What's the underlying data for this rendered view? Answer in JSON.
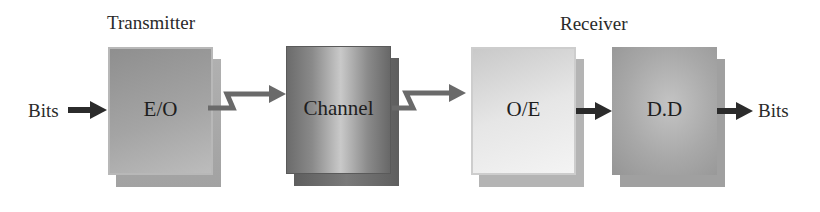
{
  "diagram": {
    "groups": [
      {
        "label": "Transmitter"
      },
      {
        "label": "Receiver"
      }
    ],
    "input_label": "Bits",
    "output_label": "Bits",
    "blocks": [
      {
        "id": "eo",
        "label": "E/O",
        "front_color": "#9e9e9e",
        "back_color": "#a9a9a9"
      },
      {
        "id": "channel",
        "label": "Channel",
        "front_color": "#8d8d8d",
        "back_color": "#6f6f6f"
      },
      {
        "id": "oe",
        "label": "O/E",
        "front_color": "#e4e4e4",
        "back_color": "#b3b3b3"
      },
      {
        "id": "dd",
        "label": "D.D",
        "front_color": "#aaaaaa",
        "back_color": "#9c9c9c"
      }
    ],
    "connections": [
      {
        "from": "input",
        "to": "eo",
        "style": "solid-arrow"
      },
      {
        "from": "eo",
        "to": "channel",
        "style": "zigzag-arrow"
      },
      {
        "from": "channel",
        "to": "oe",
        "style": "zigzag-arrow"
      },
      {
        "from": "oe",
        "to": "dd",
        "style": "solid-arrow"
      },
      {
        "from": "dd",
        "to": "output",
        "style": "solid-arrow"
      }
    ],
    "colors": {
      "solid_arrow": "#2b2b2b",
      "zigzag_arrow": "#6a6a6a"
    }
  }
}
